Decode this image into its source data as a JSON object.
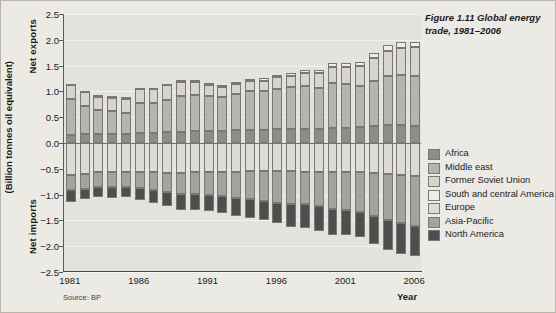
{
  "figure": {
    "title": "Figure 1.11 Global energy trade, 1981–2006",
    "source": "Source: BP"
  },
  "axes": {
    "y_title": "(Billion tonnes oil equivalent)",
    "y_positive_label": "Net exports",
    "y_negative_label": "Net imports",
    "x_title": "Year",
    "y_ticks": [
      "2.5",
      "2.0",
      "1.5",
      "1.0",
      "0.5",
      "0.0",
      "−0.5",
      "−1.0",
      "−1.5",
      "−2.0",
      "−2.5"
    ],
    "x_tick_labels": [
      "1981",
      "1986",
      "1991",
      "1996",
      "2001",
      "2006"
    ],
    "x_tick_indices": [
      0,
      5,
      10,
      15,
      20,
      25
    ]
  },
  "legend": {
    "items": [
      {
        "label": "Africa",
        "color": "#8d8d8d"
      },
      {
        "label": "Middle east",
        "color": "#b4b4b2"
      },
      {
        "label": "Former Soviet Union",
        "color": "#d5d4cf"
      },
      {
        "label": "South and central America",
        "color": "#eeede9"
      },
      {
        "label": "Europe",
        "color": "#dcdbd6"
      },
      {
        "label": "Asia-Pacific",
        "color": "#a3a3a1"
      },
      {
        "label": "North America",
        "color": "#4e4e4e"
      }
    ]
  },
  "chart_data": {
    "type": "bar",
    "title": "Figure 1.11 Global energy trade, 1981–2006",
    "subtitle": "",
    "xlabel": "Year",
    "ylabel": "(Billion tonnes oil equivalent)",
    "ylim": [
      -2.5,
      2.5
    ],
    "ytick_step": 0.5,
    "grid": true,
    "stacked": true,
    "legend_position": "right",
    "note": "Positive values are net exports, negative values are net imports, in billion tonnes oil equivalent.",
    "categories": [
      "1981",
      "1982",
      "1983",
      "1984",
      "1985",
      "1986",
      "1987",
      "1988",
      "1989",
      "1990",
      "1991",
      "1992",
      "1993",
      "1994",
      "1995",
      "1996",
      "1997",
      "1998",
      "1999",
      "2000",
      "2001",
      "2002",
      "2003",
      "2004",
      "2005",
      "2006"
    ],
    "series": [
      {
        "name": "Africa",
        "color": "#8d8d8d",
        "values": [
          0.16,
          0.17,
          0.17,
          0.17,
          0.18,
          0.19,
          0.19,
          0.21,
          0.22,
          0.23,
          0.24,
          0.24,
          0.25,
          0.26,
          0.26,
          0.27,
          0.28,
          0.28,
          0.28,
          0.3,
          0.3,
          0.31,
          0.33,
          0.34,
          0.34,
          0.33
        ]
      },
      {
        "name": "Middle east",
        "color": "#b4b4b2",
        "values": [
          0.7,
          0.55,
          0.47,
          0.45,
          0.41,
          0.58,
          0.58,
          0.63,
          0.69,
          0.7,
          0.68,
          0.66,
          0.7,
          0.74,
          0.74,
          0.78,
          0.8,
          0.83,
          0.79,
          0.86,
          0.84,
          0.8,
          0.88,
          0.95,
          0.97,
          0.97
        ]
      },
      {
        "name": "Former Soviet Union",
        "color": "#d5d4cf",
        "values": [
          0.27,
          0.27,
          0.26,
          0.26,
          0.27,
          0.27,
          0.27,
          0.28,
          0.28,
          0.26,
          0.21,
          0.18,
          0.19,
          0.2,
          0.21,
          0.22,
          0.22,
          0.24,
          0.28,
          0.31,
          0.33,
          0.38,
          0.44,
          0.5,
          0.54,
          0.56
        ]
      },
      {
        "name": "South and central America",
        "color": "#eeede9",
        "values": [
          0.02,
          0.02,
          0.03,
          0.03,
          0.03,
          0.03,
          0.03,
          0.03,
          0.03,
          0.04,
          0.04,
          0.04,
          0.04,
          0.05,
          0.05,
          0.05,
          0.06,
          0.06,
          0.07,
          0.08,
          0.08,
          0.08,
          0.09,
          0.1,
          0.1,
          0.1
        ]
      },
      {
        "name": "Europe",
        "color": "#dcdbd6",
        "values": [
          -0.62,
          -0.6,
          -0.57,
          -0.56,
          -0.56,
          -0.56,
          -0.57,
          -0.58,
          -0.58,
          -0.57,
          -0.57,
          -0.56,
          -0.56,
          -0.55,
          -0.55,
          -0.55,
          -0.55,
          -0.56,
          -0.56,
          -0.56,
          -0.57,
          -0.57,
          -0.59,
          -0.6,
          -0.62,
          -0.63
        ]
      },
      {
        "name": "Asia-Pacific",
        "color": "#a3a3a1",
        "values": [
          -0.3,
          -0.29,
          -0.29,
          -0.3,
          -0.3,
          -0.32,
          -0.34,
          -0.37,
          -0.4,
          -0.42,
          -0.44,
          -0.47,
          -0.5,
          -0.53,
          -0.57,
          -0.61,
          -0.64,
          -0.63,
          -0.67,
          -0.71,
          -0.72,
          -0.76,
          -0.82,
          -0.9,
          -0.94,
          -0.97
        ]
      },
      {
        "name": "North America",
        "color": "#4e4e4e",
        "values": [
          -0.23,
          -0.19,
          -0.18,
          -0.2,
          -0.19,
          -0.23,
          -0.25,
          -0.28,
          -0.31,
          -0.31,
          -0.31,
          -0.33,
          -0.36,
          -0.38,
          -0.38,
          -0.4,
          -0.44,
          -0.46,
          -0.48,
          -0.51,
          -0.5,
          -0.5,
          -0.54,
          -0.58,
          -0.6,
          -0.59
        ]
      }
    ]
  }
}
